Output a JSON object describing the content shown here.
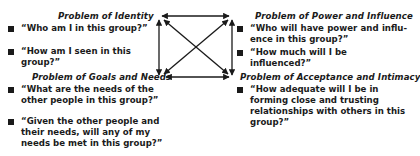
{
  "quadrants": {
    "identity": {
      "heading": "Problem of Identity",
      "items": [
        "“Who am I in this group?”",
        "“How am I seen in this group?”"
      ]
    },
    "power": {
      "heading": "Problem of Power and Influence",
      "items": [
        "“Who will have power and influ-ence in this group?”",
        "“How much will I be influenced?”"
      ]
    },
    "goals": {
      "heading": "Problem of Goals and Needs",
      "items": [
        "“What are the needs of the other people in this group?”",
        "“Given the other people and their needs, will any of my needs be met in this group?”"
      ]
    },
    "acceptance": {
      "heading": "Problem of Acceptance and Intimacy",
      "items": [
        "“How adequate will I be in forming close and trusting relationships with others in this group?”"
      ]
    }
  },
  "diagram": {
    "connector": "bidirectional-arrows-between-all-four-problems",
    "color": "#1a1a1a"
  }
}
